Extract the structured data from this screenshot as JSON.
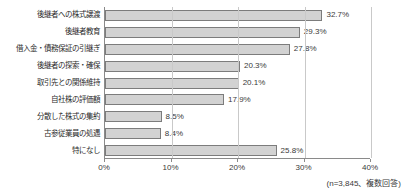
{
  "chart_data": {
    "type": "bar",
    "orientation": "horizontal",
    "title": "",
    "subtitle": "",
    "xlabel": "",
    "ylabel": "",
    "xlim": [
      0,
      40
    ],
    "grid": true,
    "legend": null,
    "categories": [
      "後継者への株式譲渡",
      "後継者教育",
      "借入金・債務保証の引継ぎ",
      "後継者の探索・確保",
      "取引先との関係維持",
      "自社株の評価額",
      "分散した株式の集約",
      "古参従業員の処遇",
      "特になし"
    ],
    "values": [
      32.7,
      29.3,
      27.8,
      20.3,
      20.1,
      17.9,
      8.5,
      8.4,
      25.8
    ],
    "value_labels": [
      "32.7%",
      "29.3%",
      "27.8%",
      "20.3%",
      "20.1%",
      "17.9%",
      "8.5%",
      "8.4%",
      "25.8%"
    ],
    "xticks": [
      0,
      10,
      20,
      30,
      40
    ],
    "xtick_labels": [
      "0%",
      "10%",
      "20%",
      "30%",
      "40%"
    ],
    "bar_color": "#d2d2d2",
    "bar_border_color": "#7c7c7c",
    "axis_color": "#8a8a8a",
    "grid_color": "#c9c9c9",
    "text_color": "#2b2b2b",
    "background": "#ffffff",
    "note": "(n=3,845、複数回答)"
  }
}
